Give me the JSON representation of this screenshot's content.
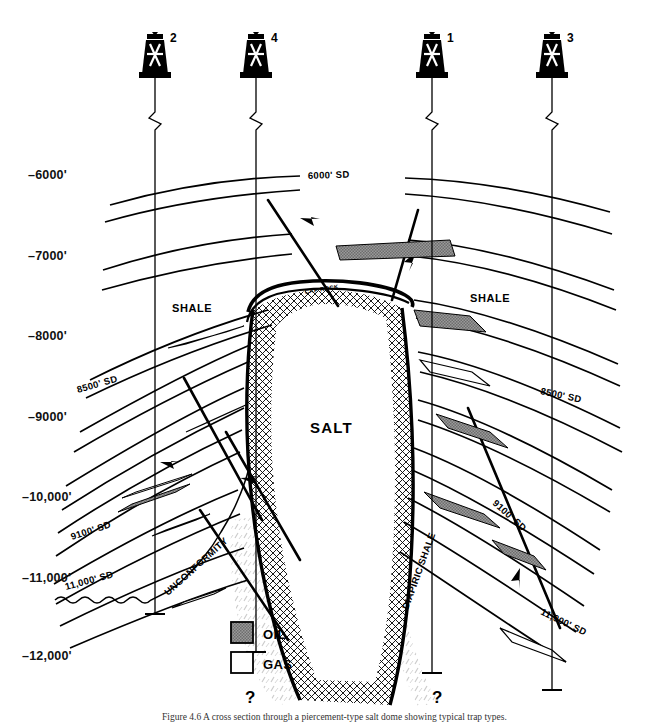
{
  "figure": {
    "title_caption": "Figure 4.6  A cross section through a piercement-type salt dome showing typical trap types.",
    "header_faint": "",
    "depth_axis": {
      "unit": "feet subsea",
      "labels": [
        "–6000'",
        "–7000'",
        "–8000'",
        "–9000'",
        "–10,000'",
        "–11,000'",
        "–12,000'"
      ],
      "y_positions": [
        175,
        256,
        336,
        417,
        497,
        578,
        656
      ]
    },
    "wells": [
      {
        "number": "2",
        "x": 155,
        "icon": "derrick-icon",
        "bottom_y": 614
      },
      {
        "number": "4",
        "x": 256,
        "icon": "derrick-icon",
        "bottom_y": 652
      },
      {
        "number": "1",
        "x": 432,
        "icon": "derrick-icon",
        "bottom_y": 673
      },
      {
        "number": "3",
        "x": 552,
        "icon": "derrick-icon",
        "bottom_y": 690
      }
    ],
    "unit_labels": [
      {
        "text": "SHALE",
        "x": 172,
        "y": 312
      },
      {
        "text": "SHALE",
        "x": 470,
        "y": 302
      },
      {
        "text": "SALT",
        "x": 337,
        "y": 427
      },
      {
        "text": "CAP ROCK",
        "x": 330,
        "y": 293,
        "rotate": -9,
        "size": "tiny"
      },
      {
        "text": "UNCONFORMITY",
        "x": 200,
        "y": 580,
        "rotate": -38
      },
      {
        "text": "DIAPIRIC SHALE",
        "x": 400,
        "y": 580,
        "rotate": -72
      }
    ],
    "sand_labels": [
      {
        "text": "6000' SD",
        "x": 333,
        "y": 177,
        "rotate": -2
      },
      {
        "text": "8500' SD",
        "x": 105,
        "y": 387,
        "rotate": -14
      },
      {
        "text": "8500' SD",
        "x": 575,
        "y": 392,
        "rotate": 10
      },
      {
        "text": "9100' SD",
        "x": 100,
        "y": 533,
        "rotate": -16
      },
      {
        "text": "9100' SD",
        "x": 518,
        "y": 511,
        "rotate": 43
      },
      {
        "text": "11,000' SD",
        "x": 98,
        "y": 583,
        "rotate": -14
      },
      {
        "text": "11,000' SD",
        "x": 570,
        "y": 607,
        "rotate": 25
      }
    ],
    "legend": {
      "items": [
        {
          "label": "OIL",
          "fill": "#8c8c8c",
          "pattern": "checker"
        },
        {
          "label": "GAS",
          "fill": "#ffffff",
          "pattern": "solid"
        }
      ],
      "x": 231,
      "y": 628
    },
    "query_marks": [
      {
        "text": "?",
        "x": 250,
        "y": 700
      },
      {
        "text": "?",
        "x": 437,
        "y": 700
      }
    ],
    "colors": {
      "line": "#000000",
      "oil_fill": "#8c8c8c",
      "gas_fill": "#ffffff",
      "salt_hatch": "#000000",
      "diapiric_shale": "#d6d6d6",
      "background": "#ffffff"
    }
  }
}
